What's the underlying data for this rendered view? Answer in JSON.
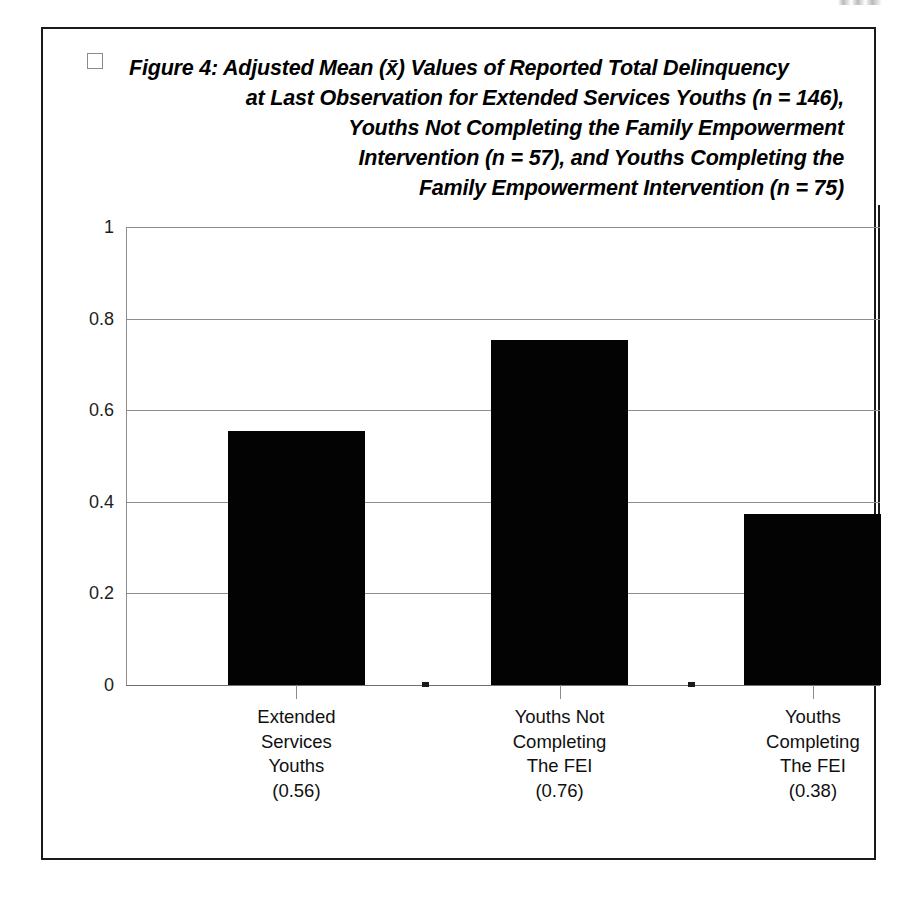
{
  "figure": {
    "bullet_icon": "square-bullet-icon",
    "title_lines": [
      "Figure 4:  Adjusted Mean (x̄) Values of Reported Total Delinquency",
      "at Last Observation for Extended Services Youths (n = 146),",
      "Youths Not Completing the Family Empowerment",
      "Intervention (n = 57), and Youths Completing the",
      "Family Empowerment Intervention  (n = 75)"
    ]
  },
  "chart_data": {
    "type": "bar",
    "categories": [
      "Extended Services Youths (0.56)",
      "Youths Not Completing The FEI (0.76)",
      "Youths Completing The FEI (0.38)"
    ],
    "category_label_lines": [
      [
        "Extended",
        "Services",
        "Youths",
        "(0.56)"
      ],
      [
        "Youths Not",
        "Completing",
        "The FEI",
        "(0.76)"
      ],
      [
        "Youths",
        "Completing",
        "The FEI",
        "(0.38)"
      ]
    ],
    "values": [
      0.555,
      0.753,
      0.373
    ],
    "reported_values": [
      0.56,
      0.76,
      0.38
    ],
    "xlabel": "",
    "ylabel": "",
    "ylim": [
      0,
      1
    ],
    "yticks": [
      0,
      0.2,
      0.4,
      0.6,
      0.8,
      1
    ],
    "ytick_labels": [
      "0",
      "0.2",
      "0.4",
      "0.6",
      "0.8",
      "1"
    ],
    "grid": true,
    "legend": false,
    "bar_color": "#030303",
    "gridline_color": "#8d8d8d",
    "bar_centers_pct": [
      22.6,
      57.5,
      91.1
    ],
    "bar_width_pct": 18.2
  }
}
